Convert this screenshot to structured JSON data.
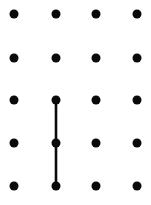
{
  "canvas": {
    "width": 151,
    "height": 205,
    "background_color": "#ffffff",
    "title": "dot-grid-with-line"
  },
  "grid": {
    "columns": 4,
    "rows": 5,
    "column_x": [
      14,
      56,
      96,
      137
    ],
    "row_y": [
      14,
      58,
      100,
      143,
      186
    ],
    "dot_radius": 4.5,
    "dot_color": "#0a0a0a",
    "dot_count": 20,
    "dot_shape": "circle"
  },
  "dots": [
    {
      "id": "dot-r1c1",
      "col": 1,
      "row": 1,
      "x": 14,
      "y": 14
    },
    {
      "id": "dot-r1c2",
      "col": 2,
      "row": 1,
      "x": 56,
      "y": 14
    },
    {
      "id": "dot-r1c3",
      "col": 3,
      "row": 1,
      "x": 96,
      "y": 14
    },
    {
      "id": "dot-r1c4",
      "col": 4,
      "row": 1,
      "x": 137,
      "y": 14
    },
    {
      "id": "dot-r2c1",
      "col": 1,
      "row": 2,
      "x": 14,
      "y": 58
    },
    {
      "id": "dot-r2c2",
      "col": 2,
      "row": 2,
      "x": 56,
      "y": 58
    },
    {
      "id": "dot-r2c3",
      "col": 3,
      "row": 2,
      "x": 96,
      "y": 58
    },
    {
      "id": "dot-r2c4",
      "col": 4,
      "row": 2,
      "x": 137,
      "y": 58
    },
    {
      "id": "dot-r3c1",
      "col": 1,
      "row": 3,
      "x": 14,
      "y": 100
    },
    {
      "id": "dot-r3c2",
      "col": 2,
      "row": 3,
      "x": 56,
      "y": 100
    },
    {
      "id": "dot-r3c3",
      "col": 3,
      "row": 3,
      "x": 96,
      "y": 100
    },
    {
      "id": "dot-r3c4",
      "col": 4,
      "row": 3,
      "x": 137,
      "y": 100
    },
    {
      "id": "dot-r4c1",
      "col": 1,
      "row": 4,
      "x": 14,
      "y": 143
    },
    {
      "id": "dot-r4c2",
      "col": 2,
      "row": 4,
      "x": 56,
      "y": 143
    },
    {
      "id": "dot-r4c3",
      "col": 3,
      "row": 4,
      "x": 96,
      "y": 143
    },
    {
      "id": "dot-r4c4",
      "col": 4,
      "row": 4,
      "x": 137,
      "y": 143
    },
    {
      "id": "dot-r5c1",
      "col": 1,
      "row": 5,
      "x": 14,
      "y": 186
    },
    {
      "id": "dot-r5c2",
      "col": 2,
      "row": 5,
      "x": 56,
      "y": 186
    },
    {
      "id": "dot-r5c3",
      "col": 3,
      "row": 5,
      "x": 96,
      "y": 186
    },
    {
      "id": "dot-r5c4",
      "col": 4,
      "row": 5,
      "x": 137,
      "y": 186
    }
  ],
  "lines": [
    {
      "id": "line-c2-r3-to-r5",
      "orientation": "vertical",
      "from_dot": "dot-r3c2",
      "to_dot": "dot-r5c2",
      "x1": 56,
      "y1": 100,
      "x2": 56,
      "y2": 186,
      "width": 2.6,
      "color": "#0a0a0a"
    }
  ]
}
